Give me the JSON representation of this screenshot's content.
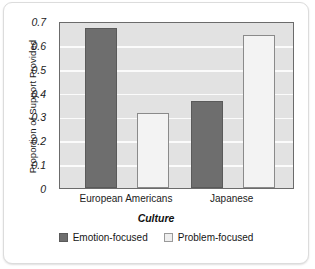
{
  "chart_data": {
    "type": "bar",
    "title": "",
    "xlabel": "Culture",
    "ylabel": "Proportion of Support Provided",
    "categories": [
      "European Americans",
      "Japanese"
    ],
    "series": [
      {
        "name": "Emotion-focused",
        "color": "#6e6e6e",
        "values": [
          0.67,
          0.365
        ]
      },
      {
        "name": "Problem-focused",
        "color": "#f3f3f3",
        "values": [
          0.315,
          0.64
        ]
      }
    ],
    "ylim": [
      0,
      0.7
    ],
    "yticks": [
      "0.7",
      "0.6",
      "0.5",
      "0.4",
      "0.3",
      "0.2",
      "0.1",
      "0"
    ],
    "ytick_values": [
      0.7,
      0.6,
      0.5,
      0.4,
      0.3,
      0.2,
      0.1,
      0
    ],
    "grid": true,
    "legend_position": "bottom",
    "plot_background": "#e2e2e2",
    "gridline_color": "#fbfbfb",
    "frame_color": "#6b6b6b"
  }
}
